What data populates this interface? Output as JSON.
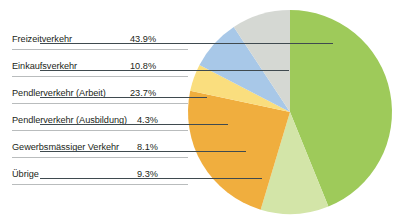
{
  "chart_data": {
    "type": "pie",
    "title": "",
    "subtitle": "",
    "xlabel": "",
    "ylabel": "",
    "legend_position": "left-table",
    "grid": false,
    "unit": "%",
    "categories": [
      "Freizeitverkehr",
      "Einkaufsverkehr",
      "Pendlerverkehr (Arbeit)",
      "Pendlerverkehr (Ausbildung)",
      "Gewerbsmässiger Verkehr",
      "Übrige"
    ],
    "values": [
      43.9,
      10.8,
      23.7,
      4.3,
      8.1,
      9.3
    ],
    "value_labels": [
      "43.9%",
      "10.8%",
      "23.7%",
      "4.3%",
      "8.1%",
      "9.3%"
    ],
    "colors": [
      "#9ECA5A",
      "#D3E5A8",
      "#F0AE3E",
      "#FADE7E",
      "#A8C8E8",
      "#D5D8D3"
    ],
    "series": [
      {
        "name": "Verkehrszweck",
        "values": [
          43.9,
          10.8,
          23.7,
          4.3,
          8.1,
          9.3
        ]
      }
    ]
  },
  "legend": {
    "rows": [
      {
        "label": "Freizeitverkehr",
        "value": "43.9%"
      },
      {
        "label": "Einkaufsverkehr",
        "value": "10.8%"
      },
      {
        "label": "Pendlerverkehr (Arbeit)",
        "value": "23.7%"
      },
      {
        "label": "Pendlerverkehr (Ausbildung)",
        "value": "4.3%"
      },
      {
        "label": "Gewerbsmässiger Verkehr",
        "value": "8.1%"
      },
      {
        "label": "Übrige",
        "value": "9.3%"
      }
    ]
  },
  "pie": {
    "slices": [
      {
        "name": "Freizeitverkehr",
        "percent": "43.9%",
        "color": "#9ECA5A"
      },
      {
        "name": "Einkaufsverkehr",
        "percent": "10.8%",
        "color": "#D3E5A8"
      },
      {
        "name": "Pendlerverkehr (Arbeit)",
        "percent": "23.7%",
        "color": "#F0AE3E"
      },
      {
        "name": "Pendlerverkehr (Ausbildung)",
        "percent": "4.3%",
        "color": "#FADE7E"
      },
      {
        "name": "Gewerbsmässiger Verkehr",
        "percent": "8.1%",
        "color": "#A8C8E8"
      },
      {
        "name": "Übrige",
        "percent": "9.3%",
        "color": "#D5D8D3"
      }
    ]
  }
}
